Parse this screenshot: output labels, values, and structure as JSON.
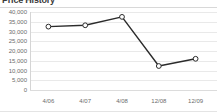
{
  "widget": {
    "title": "Price History",
    "line_color": "#2b2b2b",
    "marker_fill": "#ffffff",
    "marker_stroke": "#2b2b2b",
    "grid_color": "#e9e9e9",
    "axis_text_color": "#6b6b6b",
    "background": "#ffffff"
  },
  "chart_data": {
    "type": "line",
    "title": "Price History",
    "xlabel": "",
    "ylabel": "",
    "categories": [
      "4/06",
      "4/07",
      "4/08",
      "12/08",
      "12/09"
    ],
    "series": [
      {
        "name": "Price",
        "values": [
          32500,
          33200,
          37500,
          12300,
          16000
        ]
      }
    ],
    "ylim": [
      0,
      40000
    ],
    "yticks": [
      0,
      5000,
      10000,
      15000,
      20000,
      25000,
      30000,
      35000,
      40000
    ],
    "ytick_labels": [
      "0",
      "5,000",
      "10,000",
      "15,000",
      "20,000",
      "25,000",
      "30,000",
      "35,000",
      "40,000"
    ],
    "grid": true,
    "legend": false,
    "markers": "open-circle"
  }
}
